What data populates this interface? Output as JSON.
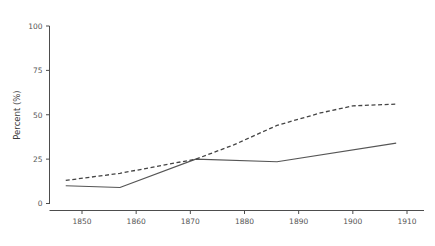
{
  "chart_data": {
    "type": "line",
    "title": "",
    "xlabel": "",
    "ylabel": "Percent (%)",
    "xlim": [
      1845,
      1911
    ],
    "ylim": [
      0,
      100
    ],
    "grid": false,
    "legend": "none",
    "yticks": [
      0,
      25,
      50,
      75,
      100
    ],
    "ytick_labels": [
      "0",
      "25",
      "50",
      "75",
      "100"
    ],
    "xticks": [
      1850,
      1860,
      1870,
      1880,
      1890,
      1900,
      1910
    ],
    "xtick_labels": [
      "1850",
      "1860",
      "1870",
      "1880",
      "1890",
      "1900",
      "1910"
    ],
    "series": [
      {
        "name": "solid-series",
        "style": "solid",
        "color": "#555555",
        "x": [
          1847,
          1857,
          1871,
          1886,
          1908
        ],
        "values": [
          10,
          9,
          25,
          23.5,
          34
        ]
      },
      {
        "name": "dashed-series",
        "style": "dashed",
        "color": "#444444",
        "x": [
          1847,
          1857,
          1871,
          1878,
          1886,
          1894,
          1900,
          1908
        ],
        "values": [
          13,
          17,
          25,
          33,
          44,
          51,
          55,
          56
        ]
      }
    ]
  },
  "axes": {
    "y_title": "Percent (%)"
  },
  "colors": {
    "axis": "#4d4d4d",
    "tick_text": "#555555",
    "background": "#ffffff"
  }
}
